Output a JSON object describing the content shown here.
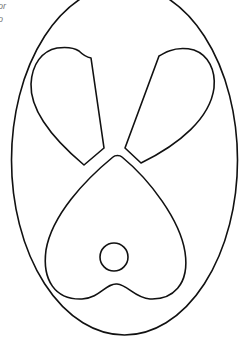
{
  "caption": {
    "lines": [
      "or",
      "o"
    ]
  },
  "figure": {
    "stroke_color": "#111111",
    "background_color": "#ffffff",
    "shapes": [
      {
        "name": "outer-oval",
        "type": "ellipse"
      },
      {
        "name": "left-lobe",
        "type": "petal"
      },
      {
        "name": "right-lobe",
        "type": "petal"
      },
      {
        "name": "bottom-heart",
        "type": "heart"
      },
      {
        "name": "small-circle",
        "type": "circle"
      }
    ]
  }
}
